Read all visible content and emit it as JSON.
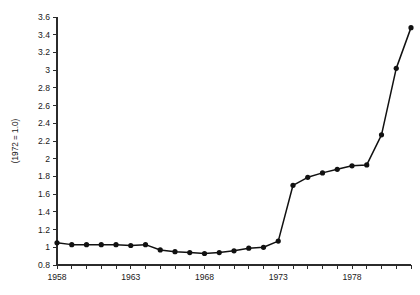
{
  "chart_data": {
    "type": "line",
    "title": "",
    "subtitle": "",
    "xlabel": "",
    "ylabel": "(1972 = 1.0)",
    "xlim": [
      1958,
      1982
    ],
    "ylim": [
      0.8,
      3.6
    ],
    "grid": false,
    "legend": null,
    "x_tick_labels": [
      "1958",
      "1963",
      "1968",
      "1973",
      "1978"
    ],
    "x_tick_values": [
      1958,
      1963,
      1968,
      1973,
      1978
    ],
    "x_minor_tick_step": 1,
    "y_tick_labels": [
      "0.8",
      "1",
      "1.2",
      "1.4",
      "1.6",
      "1.8",
      "2",
      "2.2",
      "2.4",
      "2.6",
      "2.8",
      "3",
      "3.2",
      "3.4",
      "3.6"
    ],
    "y_tick_values": [
      0.8,
      1.0,
      1.2,
      1.4,
      1.6,
      1.8,
      2.0,
      2.2,
      2.4,
      2.6,
      2.8,
      3.0,
      3.2,
      3.4,
      3.6
    ],
    "series": [
      {
        "name": "index",
        "marker": "circle",
        "color": "#111111",
        "x": [
          1958,
          1959,
          1960,
          1961,
          1962,
          1963,
          1964,
          1965,
          1966,
          1967,
          1968,
          1969,
          1970,
          1971,
          1972,
          1973,
          1974,
          1975,
          1976,
          1977,
          1978,
          1979,
          1980,
          1981,
          1982
        ],
        "values": [
          1.05,
          1.03,
          1.03,
          1.03,
          1.03,
          1.02,
          1.03,
          0.97,
          0.95,
          0.94,
          0.93,
          0.94,
          0.96,
          0.99,
          1.0,
          1.07,
          1.7,
          1.79,
          1.84,
          1.88,
          1.92,
          1.93,
          2.27,
          3.02,
          3.48
        ]
      }
    ]
  },
  "layout": {
    "plot_left": 57,
    "plot_right": 411,
    "plot_top": 17,
    "plot_bottom": 265,
    "tick_len": 4,
    "dot_radius": 2.6
  }
}
